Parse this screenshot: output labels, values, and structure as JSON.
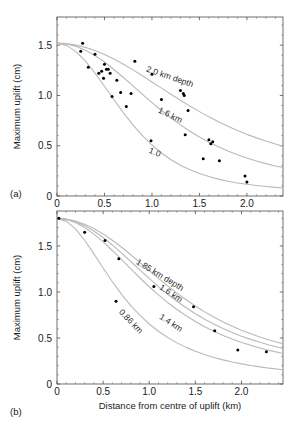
{
  "figure": {
    "panel_a_label": "(a)",
    "panel_b_label": "(b)",
    "xlabel": "Distance from centre of uplift  (km)",
    "ylabel": "Maximum uplift  (cm)",
    "curve_color": "#b9b9b9",
    "point_color": "#000000",
    "axis_color": "#4d4d4d"
  },
  "chart_data": [
    {
      "type": "scatter",
      "panel": "(a)",
      "title": "",
      "xlabel": "",
      "ylabel": "Maximum uplift  (cm)",
      "xlim": [
        0,
        2.38
      ],
      "ylim": [
        0,
        1.78
      ],
      "xticks": [
        0,
        0.5,
        1.0,
        1.5,
        2.0
      ],
      "xticklabels": [
        "0",
        "0.5",
        "1.0",
        "1.5",
        "2.0"
      ],
      "yticks": [
        0,
        0.5,
        1.0,
        1.5
      ],
      "yticklabels": [
        "0",
        "0.5",
        "1.0",
        "1.5"
      ],
      "xminorticks": [
        0.1,
        0.2,
        0.3,
        0.4,
        0.6,
        0.7,
        0.8,
        0.9,
        1.1,
        1.2,
        1.3,
        1.4,
        1.6,
        1.7,
        1.8,
        1.9,
        2.1,
        2.2,
        2.3
      ],
      "yminorticks": [
        0.1,
        0.2,
        0.3,
        0.4,
        0.6,
        0.7,
        0.8,
        0.9,
        1.1,
        1.2,
        1.3,
        1.4,
        1.6,
        1.7
      ],
      "grid": false,
      "legend": "inline-curve-labels",
      "points": {
        "name": "observed maximum uplift",
        "x": [
          0.25,
          0.27,
          0.33,
          0.4,
          0.44,
          0.47,
          0.49,
          0.5,
          0.52,
          0.54,
          0.56,
          0.58,
          0.63,
          0.67,
          0.73,
          0.78,
          0.82,
          0.99,
          1.0,
          1.1,
          1.3,
          1.33,
          1.34,
          1.35,
          1.38,
          1.54,
          1.6,
          1.62,
          1.64,
          1.71,
          1.98,
          2.0
        ],
        "y": [
          1.44,
          1.52,
          1.28,
          1.41,
          1.22,
          1.24,
          1.17,
          1.31,
          1.26,
          1.26,
          1.22,
          0.99,
          1.15,
          1.03,
          0.89,
          1.02,
          1.34,
          0.55,
          1.21,
          0.96,
          1.05,
          1.02,
          1.0,
          0.61,
          0.85,
          0.37,
          0.56,
          0.52,
          0.54,
          0.35,
          0.2,
          0.14
        ]
      },
      "series": [
        {
          "name": "2.0 km depth",
          "label": "2.0 km depth",
          "label_x": 1.18,
          "label_y": 1.16,
          "label_rotation": 19,
          "x": [
            0,
            0.1,
            0.2,
            0.3,
            0.4,
            0.5,
            0.6,
            0.7,
            0.8,
            0.9,
            1.0,
            1.1,
            1.2,
            1.3,
            1.4,
            1.5,
            1.6,
            1.7,
            1.8,
            1.9,
            2.0,
            2.1,
            2.2,
            2.3,
            2.38
          ],
          "y": [
            1.52,
            1.515,
            1.5,
            1.478,
            1.447,
            1.408,
            1.362,
            1.31,
            1.254,
            1.195,
            1.134,
            1.073,
            1.012,
            0.952,
            0.894,
            0.839,
            0.787,
            0.738,
            0.693,
            0.651,
            0.613,
            0.578,
            0.546,
            0.517,
            0.495
          ]
        },
        {
          "name": "1.6 km",
          "label": "1.6 km",
          "label_x": 1.18,
          "label_y": 0.78,
          "label_rotation": 26,
          "x": [
            0,
            0.1,
            0.2,
            0.3,
            0.4,
            0.5,
            0.6,
            0.7,
            0.8,
            0.9,
            1.0,
            1.1,
            1.2,
            1.3,
            1.4,
            1.5,
            1.6,
            1.7,
            1.8,
            1.9,
            2.0,
            2.1,
            2.2,
            2.3,
            2.38
          ],
          "y": [
            1.52,
            1.512,
            1.488,
            1.449,
            1.396,
            1.332,
            1.258,
            1.178,
            1.095,
            1.011,
            0.929,
            0.85,
            0.776,
            0.707,
            0.644,
            0.587,
            0.535,
            0.489,
            0.447,
            0.41,
            0.377,
            0.348,
            0.322,
            0.299,
            0.283
          ]
        },
        {
          "name": "1.0",
          "label": "1.0",
          "label_x": 1.02,
          "label_y": 0.41,
          "label_rotation": 22,
          "x": [
            0,
            0.1,
            0.2,
            0.3,
            0.4,
            0.5,
            0.6,
            0.7,
            0.8,
            0.9,
            1.0,
            1.1,
            1.2,
            1.3,
            1.4,
            1.5,
            1.6,
            1.7,
            1.8,
            1.9,
            2.0,
            2.1,
            2.2,
            2.3,
            2.38
          ],
          "y": [
            1.52,
            1.498,
            1.436,
            1.341,
            1.222,
            1.091,
            0.957,
            0.827,
            0.707,
            0.6,
            0.507,
            0.428,
            0.361,
            0.306,
            0.261,
            0.224,
            0.193,
            0.168,
            0.147,
            0.13,
            0.116,
            0.104,
            0.094,
            0.086,
            0.08
          ]
        }
      ]
    },
    {
      "type": "scatter",
      "panel": "(b)",
      "title": "",
      "xlabel": "Distance from centre of uplift  (km)",
      "ylabel": "Maximum uplift  (cm)",
      "xlim": [
        0,
        2.45
      ],
      "ylim": [
        0,
        1.88
      ],
      "xticks": [
        0,
        0.5,
        1.0,
        1.5,
        2.0
      ],
      "xticklabels": [
        "0",
        "0.5",
        "1.0",
        "1.5",
        "2.0"
      ],
      "yticks": [
        0,
        0.5,
        1.0,
        1.5
      ],
      "yticklabels": [
        "0",
        "0.5",
        "1.0",
        "1.5"
      ],
      "xminorticks": [
        0.1,
        0.2,
        0.3,
        0.4,
        0.6,
        0.7,
        0.8,
        0.9,
        1.1,
        1.2,
        1.3,
        1.4,
        1.6,
        1.7,
        1.8,
        1.9,
        2.1,
        2.2,
        2.3,
        2.4
      ],
      "yminorticks": [
        0.1,
        0.2,
        0.3,
        0.4,
        0.6,
        0.7,
        0.8,
        0.9,
        1.1,
        1.2,
        1.3,
        1.4,
        1.6,
        1.7,
        1.8
      ],
      "grid": false,
      "legend": "inline-curve-labels",
      "points": {
        "name": "observed maximum uplift",
        "x": [
          0.02,
          0.3,
          0.52,
          0.64,
          0.67,
          1.05,
          1.48,
          1.71,
          1.96,
          2.27
        ],
        "y": [
          1.8,
          1.65,
          1.56,
          0.9,
          1.36,
          1.06,
          0.84,
          0.58,
          0.37,
          0.35
        ]
      },
      "series": [
        {
          "name": "1.85 km depth",
          "label": "1.85 km depth",
          "label_x": 1.1,
          "label_y": 1.16,
          "label_rotation": 31,
          "x": [
            0,
            0.1,
            0.2,
            0.3,
            0.4,
            0.5,
            0.6,
            0.7,
            0.8,
            0.9,
            1.0,
            1.1,
            1.2,
            1.3,
            1.4,
            1.5,
            1.6,
            1.7,
            1.8,
            1.9,
            2.0,
            2.1,
            2.2,
            2.3,
            2.45
          ],
          "y": [
            1.8,
            1.793,
            1.772,
            1.737,
            1.69,
            1.631,
            1.562,
            1.486,
            1.404,
            1.319,
            1.233,
            1.148,
            1.066,
            0.988,
            0.915,
            0.847,
            0.784,
            0.727,
            0.675,
            0.628,
            0.585,
            0.546,
            0.511,
            0.479,
            0.437
          ]
        },
        {
          "name": "1.6 km",
          "label": "1.6 km",
          "label_x": 1.22,
          "label_y": 0.96,
          "label_rotation": 33,
          "x": [
            0,
            0.1,
            0.2,
            0.3,
            0.4,
            0.5,
            0.6,
            0.7,
            0.8,
            0.9,
            1.0,
            1.1,
            1.2,
            1.3,
            1.4,
            1.5,
            1.6,
            1.7,
            1.8,
            1.9,
            2.0,
            2.1,
            2.2,
            2.3,
            2.45
          ],
          "y": [
            1.8,
            1.791,
            1.764,
            1.721,
            1.663,
            1.592,
            1.511,
            1.423,
            1.331,
            1.238,
            1.147,
            1.059,
            0.976,
            0.899,
            0.828,
            0.763,
            0.704,
            0.651,
            0.603,
            0.559,
            0.52,
            0.485,
            0.453,
            0.424,
            0.386
          ]
        },
        {
          "name": "1.4 km",
          "label": "1.4 km",
          "label_x": 1.22,
          "label_y": 0.64,
          "label_rotation": 33,
          "x": [
            0,
            0.1,
            0.2,
            0.3,
            0.4,
            0.5,
            0.6,
            0.7,
            0.8,
            0.9,
            1.0,
            1.1,
            1.2,
            1.3,
            1.4,
            1.5,
            1.6,
            1.7,
            1.8,
            1.9,
            2.0,
            2.1,
            2.2,
            2.3,
            2.45
          ],
          "y": [
            1.8,
            1.788,
            1.754,
            1.7,
            1.629,
            1.545,
            1.451,
            1.352,
            1.251,
            1.152,
            1.057,
            0.968,
            0.885,
            0.81,
            0.741,
            0.679,
            0.623,
            0.573,
            0.528,
            0.488,
            0.452,
            0.42,
            0.391,
            0.365,
            0.331
          ]
        },
        {
          "name": "0.86 km",
          "label": "0.86 km",
          "label_x": 0.78,
          "label_y": 0.66,
          "label_rotation": 46,
          "x": [
            0,
            0.1,
            0.2,
            0.3,
            0.4,
            0.5,
            0.6,
            0.7,
            0.8,
            0.9,
            1.0,
            1.1,
            1.2,
            1.3,
            1.4,
            1.5,
            1.6,
            1.7,
            1.8,
            1.9,
            2.0,
            2.1,
            2.2,
            2.3,
            2.45
          ],
          "y": [
            1.8,
            1.77,
            1.686,
            1.562,
            1.414,
            1.26,
            1.111,
            0.974,
            0.852,
            0.745,
            0.652,
            0.573,
            0.505,
            0.447,
            0.398,
            0.356,
            0.32,
            0.289,
            0.262,
            0.239,
            0.219,
            0.201,
            0.186,
            0.172,
            0.155
          ]
        }
      ]
    }
  ]
}
